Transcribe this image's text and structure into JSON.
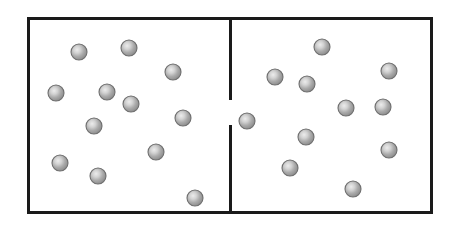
{
  "figure": {
    "type": "diagram",
    "width": 454,
    "height": 231,
    "background_color": "#ffffff"
  },
  "container": {
    "label": "outer-container",
    "x": 27,
    "y": 17,
    "width": 406,
    "height": 197,
    "stroke_color": "#1a1a1a",
    "stroke_width": 3.2,
    "fill_color": "#ffffff"
  },
  "partition": {
    "label": "central-partition",
    "x": 230.5,
    "stroke_color": "#1a1a1a",
    "stroke_width": 3.2,
    "segments": [
      {
        "name": "upper-partition-segment",
        "y_start": 17,
        "y_end": 100
      },
      {
        "name": "lower-partition-segment",
        "y_start": 125,
        "y_end": 214
      }
    ],
    "opening": {
      "name": "partition-opening",
      "y_start": 100,
      "y_end": 125,
      "height": 25
    }
  },
  "particle_style": {
    "radius": 8,
    "fill_center_color": "#e8e8e8",
    "fill_mid_color": "#a8a8a8",
    "fill_edge_color": "#888888",
    "stroke_color": "#6e6e6e",
    "stroke_width": 1.1,
    "highlight_offset_x": "38%",
    "highlight_offset_y": "36%"
  },
  "particles": {
    "total_count": 29,
    "left_chamber_count": 15,
    "right_chamber_count": 13,
    "opening_count": 1,
    "left_chamber": [
      {
        "id": "L1",
        "cx": 79,
        "cy": 52
      },
      {
        "id": "L2",
        "cx": 129,
        "cy": 48
      },
      {
        "id": "L3",
        "cx": 173,
        "cy": 72
      },
      {
        "id": "L4",
        "cx": 56,
        "cy": 93
      },
      {
        "id": "L5",
        "cx": 107,
        "cy": 92
      },
      {
        "id": "L6",
        "cx": 131,
        "cy": 104
      },
      {
        "id": "L7",
        "cx": 94,
        "cy": 126
      },
      {
        "id": "L8",
        "cx": 183,
        "cy": 118
      },
      {
        "id": "L9",
        "cx": 156,
        "cy": 152
      },
      {
        "id": "L10",
        "cx": 60,
        "cy": 163
      },
      {
        "id": "L11",
        "cx": 98,
        "cy": 176
      },
      {
        "id": "L12",
        "cx": 195,
        "cy": 198
      }
    ],
    "opening_chamber": [
      {
        "id": "O1",
        "cx": 247,
        "cy": 121
      }
    ],
    "right_chamber": [
      {
        "id": "R1",
        "cx": 322,
        "cy": 47
      },
      {
        "id": "R2",
        "cx": 275,
        "cy": 77
      },
      {
        "id": "R3",
        "cx": 307,
        "cy": 84
      },
      {
        "id": "R4",
        "cx": 389,
        "cy": 71
      },
      {
        "id": "R5",
        "cx": 346,
        "cy": 108
      },
      {
        "id": "R6",
        "cx": 383,
        "cy": 107
      },
      {
        "id": "R7",
        "cx": 306,
        "cy": 137
      },
      {
        "id": "R8",
        "cx": 389,
        "cy": 150
      },
      {
        "id": "R9",
        "cx": 290,
        "cy": 168
      },
      {
        "id": "R10",
        "cx": 353,
        "cy": 189
      }
    ]
  }
}
